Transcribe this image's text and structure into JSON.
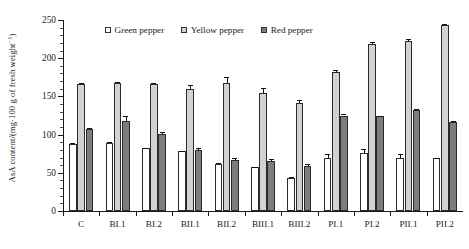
{
  "chart_data": {
    "type": "bar",
    "title": "",
    "xlabel": "",
    "ylabel": "AsA content/(mg·100 g of fresh weight⁻¹)",
    "ylabel_main": "AsA content/(mg·100 g of fresh weight",
    "ylabel_sup": "−1",
    "ylabel_tail": ")",
    "ylim": [
      0,
      250
    ],
    "ytick_step": 50,
    "yminor_step": 10,
    "grid": false,
    "legend_position": "top-center",
    "categories": [
      "C",
      "BI.1",
      "BI.2",
      "BII.1",
      "BII.2",
      "BIII.1",
      "BIII.2",
      "PI.1",
      "PI.2",
      "PII.1",
      "PII.2"
    ],
    "yticks": [
      0,
      50,
      100,
      150,
      200,
      250
    ],
    "series": [
      {
        "name": "Green pepper",
        "color": "#ffffff",
        "values": [
          88,
          89,
          82,
          78,
          62,
          57,
          43,
          70,
          76,
          70,
          69
        ],
        "errors": [
          1,
          1,
          1,
          1,
          1,
          1,
          2,
          4,
          5,
          4,
          1
        ]
      },
      {
        "name": "Yellow pepper",
        "color": "#d2d2d2",
        "values": [
          166,
          167,
          166,
          160,
          168,
          155,
          141,
          182,
          219,
          222,
          243
        ],
        "errors": [
          2,
          2,
          2,
          5,
          7,
          6,
          4,
          2,
          2,
          3,
          2
        ]
      },
      {
        "name": "Red pepper",
        "color": "#7d7d7d",
        "values": [
          107,
          118,
          101,
          80,
          67,
          65,
          59,
          125,
          124,
          132,
          117
        ],
        "errors": [
          2,
          6,
          2,
          2,
          3,
          3,
          3,
          2,
          1,
          1,
          1
        ]
      }
    ]
  }
}
